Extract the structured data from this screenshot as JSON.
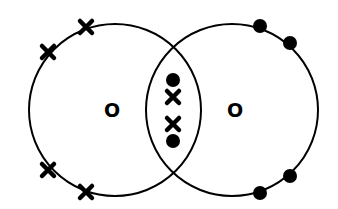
{
  "diagram": {
    "colors": {
      "stroke": "#000000",
      "background": "#ffffff"
    },
    "atoms": [
      {
        "symbol": "O",
        "center": [
          115,
          110
        ],
        "radius": 86,
        "outer_electrons": {
          "type": "cross",
          "positions": [
            [
              86,
              27
            ],
            [
              48,
              52
            ],
            [
              48,
              170
            ],
            [
              86,
              192
            ]
          ]
        }
      },
      {
        "symbol": "O",
        "center": [
          232,
          110
        ],
        "radius": 86,
        "outer_electrons": {
          "type": "dot",
          "positions": [
            [
              260,
              26
            ],
            [
              290,
              43
            ],
            [
              290,
              176
            ],
            [
              260,
              193
            ]
          ]
        }
      }
    ],
    "shared_electrons": [
      {
        "type": "dot",
        "position": [
          173,
          80
        ]
      },
      {
        "type": "cross",
        "position": [
          173,
          97
        ]
      },
      {
        "type": "cross",
        "position": [
          173,
          124
        ]
      },
      {
        "type": "dot",
        "position": [
          173,
          141
        ]
      }
    ],
    "labels": {
      "left_atom": "O",
      "right_atom": "O"
    }
  }
}
